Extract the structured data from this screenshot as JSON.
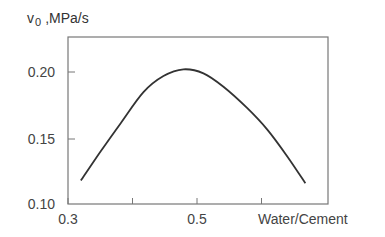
{
  "chart_data": {
    "type": "line",
    "title": "",
    "ylabel": {
      "main": "v",
      "subscript": "0",
      "unit": ",MPa/s"
    },
    "xlabel": "Water/Cement",
    "xlim": [
      0.3,
      0.7
    ],
    "ylim": [
      0.1,
      0.225
    ],
    "x_ticks": [
      0.3,
      0.4,
      0.5,
      0.6
    ],
    "x_tick_labels": [
      "0.3",
      "",
      "0.5",
      ""
    ],
    "y_ticks": [
      0.1,
      0.15,
      0.2
    ],
    "y_tick_labels": [
      "0.10",
      "0.15",
      "0.20"
    ],
    "grid": false,
    "legend": null,
    "series": [
      {
        "name": "v0",
        "x": [
          0.32,
          0.351,
          0.382,
          0.417,
          0.448,
          0.479,
          0.51,
          0.541,
          0.578,
          0.609,
          0.64,
          0.668
        ],
        "y": [
          0.119,
          0.141,
          0.162,
          0.185,
          0.197,
          0.202,
          0.199,
          0.189,
          0.173,
          0.157,
          0.137,
          0.117
        ]
      }
    ]
  }
}
